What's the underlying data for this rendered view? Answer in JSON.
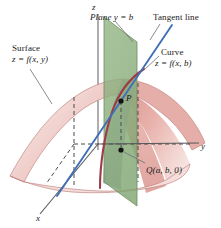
{
  "figure": {
    "background": "#ffffff"
  },
  "axes": {
    "z_label": "z",
    "y_label": "y",
    "x_label": "x"
  },
  "labels": {
    "surface_line1": "Surface",
    "surface_line2": "z = f(x, y)",
    "plane": "Plane y = b",
    "tangent_line": "Tangent line",
    "curve_line1": "Curve",
    "curve_line2": "z = f(x, b)",
    "point_p": "P",
    "point_q": "Q(a, b, 0)"
  },
  "colors": {
    "surface_fill_light": "#f7e4e2",
    "surface_fill_mid": "#eab3ae",
    "surface_fill_deep": "#d98f8b",
    "surface_edge": "#b4635f",
    "plane_fill": "#8fb082",
    "plane_edge": "#6f8f63",
    "shadow_fill": "#9aa0b4",
    "curve_stroke": "#9e3b44",
    "tangent_stroke": "#3f6fb5",
    "axis_stroke": "#58585a",
    "dash_stroke": "#4a4a4c",
    "leader_stroke": "#6e6e70",
    "text": "#1a1a1a",
    "point_dot": "#111111"
  },
  "geometry": {
    "origin": [
      98,
      144
    ],
    "z_axis_top": [
      98,
      14
    ],
    "y_axis_end": [
      199,
      143
    ],
    "x_axis_end": [
      40,
      214
    ],
    "point_p": [
      121,
      101
    ],
    "point_q": [
      121,
      144
    ],
    "plane_quad": "104,17 137,42 137,206 104,182",
    "tangent_start": [
      57,
      196
    ],
    "tangent_end": [
      170,
      27
    ]
  }
}
